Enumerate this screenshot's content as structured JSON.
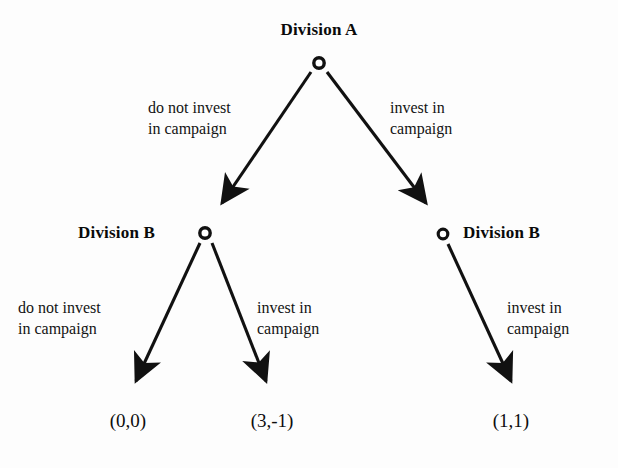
{
  "diagram": {
    "type": "extensive-form-game-tree",
    "background_color": "#fdfdfd",
    "ink_color": "#111111",
    "nodes": [
      {
        "id": "root",
        "label": "Division A",
        "x": 319,
        "y": 63,
        "label_x": 319,
        "label_y": 20,
        "label_align": "center"
      },
      {
        "id": "left_b",
        "label": "Division B",
        "x": 205,
        "y": 233,
        "label_x": 78,
        "label_y": 223,
        "label_align": "left"
      },
      {
        "id": "right_b",
        "label": "Division B",
        "x": 443,
        "y": 234,
        "label_x": 463,
        "label_y": 223,
        "label_align": "left"
      }
    ],
    "edges": [
      {
        "id": "root-left",
        "from": "root",
        "to": "left_b",
        "label_line1": "do not invest",
        "label_line2": "in campaign",
        "label_x": 148,
        "label_y": 97
      },
      {
        "id": "root-right",
        "from": "root",
        "to": "right_b",
        "label_line1": "invest in",
        "label_line2": "campaign",
        "label_x": 390,
        "label_y": 97
      },
      {
        "id": "leftb-left",
        "from": "left_b",
        "to": "payoff_00",
        "label_line1": "do not invest",
        "label_line2": "in campaign",
        "label_x": 18,
        "label_y": 297
      },
      {
        "id": "leftb-right",
        "from": "left_b",
        "to": "payoff_3m1",
        "label_line1": "invest in",
        "label_line2": "campaign",
        "label_x": 257,
        "label_y": 297
      },
      {
        "id": "rightb-right",
        "from": "right_b",
        "to": "payoff_11",
        "label_line1": "invest in",
        "label_line2": "campaign",
        "label_x": 507,
        "label_y": 297
      }
    ],
    "payoffs": [
      {
        "id": "payoff_00",
        "text": "(0,0)",
        "x": 128,
        "y": 410
      },
      {
        "id": "payoff_3m1",
        "text": "(3,-1)",
        "x": 272,
        "y": 410
      },
      {
        "id": "payoff_11",
        "text": "(1,1)",
        "x": 511,
        "y": 410
      }
    ]
  }
}
